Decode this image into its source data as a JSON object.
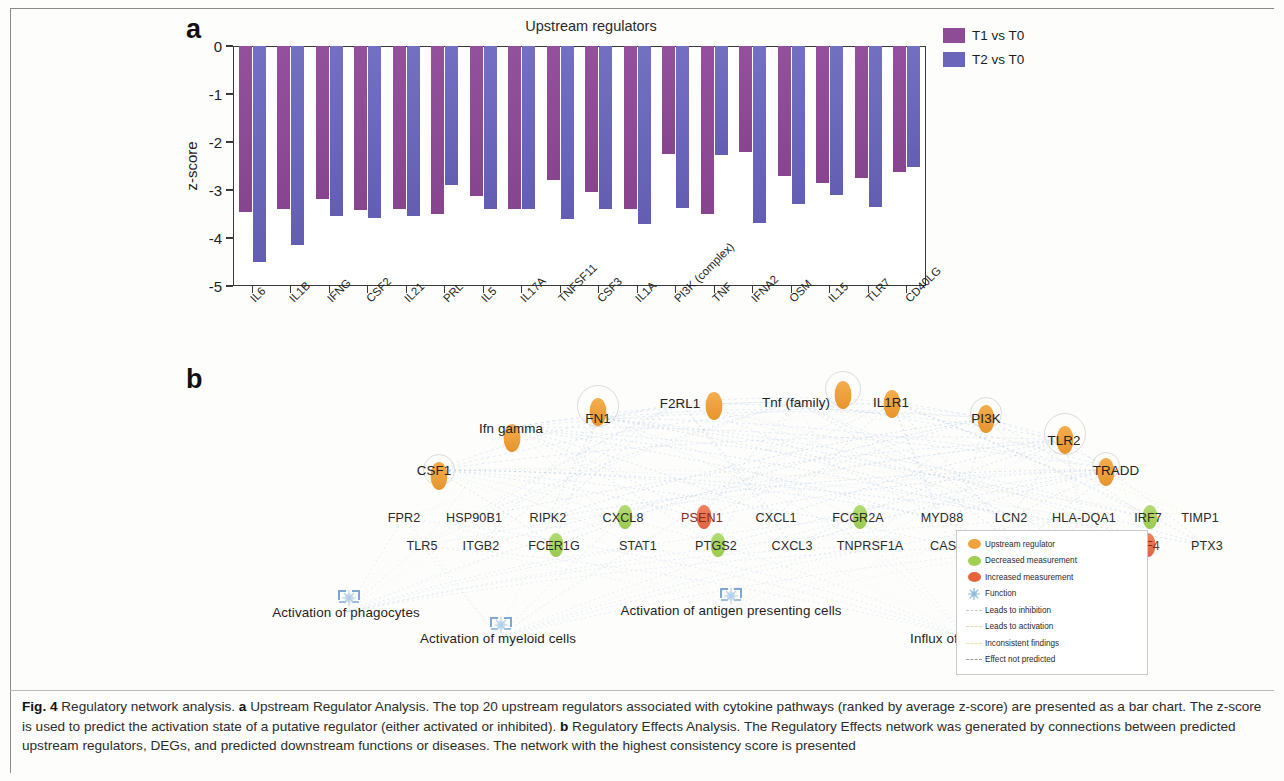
{
  "figure": {
    "label": "Fig. 4",
    "caption_parts": {
      "title": "Regulatory network analysis.",
      "a_tag": "a",
      "a_text": "Upstream Regulator Analysis. The top 20 upstream regulators associated with cytokine pathways (ranked by average z-score) are presented as a bar chart. The z-score is used to predict the activation state of a putative regulator (either activated or inhibited).",
      "b_tag": "b",
      "b_text": "Regulatory Effects Analysis. The Regulatory Effects network was generated by connections between predicted upstream regulators, DEGs, and predicted downstream functions or diseases. The network with the highest consistency score is presented"
    }
  },
  "panel_a": {
    "letter": "a",
    "title": "Upstream regulators",
    "legend": [
      {
        "label": "T1 vs T0",
        "color": "#8e4b96"
      },
      {
        "label": "T2 vs T0",
        "color": "#6b66ba"
      }
    ]
  },
  "chart_data": {
    "type": "bar",
    "title": "Upstream regulators",
    "xlabel": "",
    "ylabel": "z-score",
    "ylim": [
      -5,
      0
    ],
    "yticks": [
      0,
      -1,
      -2,
      -3,
      -4,
      -5
    ],
    "ytick_labels": [
      "0",
      "-1",
      "-2",
      "-3",
      "-4",
      "-5"
    ],
    "grid": false,
    "legend_position": "right",
    "categories": [
      "IL6",
      "IL1B",
      "IFNG",
      "CSF2",
      "IL21",
      "PRL",
      "IL5",
      "IL17A",
      "TNFSF11",
      "CSF3",
      "IL1A",
      "PI3K (complex)",
      "TNF",
      "IFNA2",
      "OSM",
      "IL15",
      "TLR7",
      "CD40LG"
    ],
    "series": [
      {
        "name": "T1 vs T0",
        "color": "#8e4b96",
        "values": [
          -3.45,
          -3.4,
          -3.18,
          -3.42,
          -3.4,
          -3.5,
          -3.12,
          -3.4,
          -2.8,
          -3.05,
          -3.4,
          -2.25,
          -3.5,
          -2.2,
          -2.7,
          -2.85,
          -2.75,
          -2.62
        ]
      },
      {
        "name": "T2 vs T0",
        "color": "#6b66ba",
        "values": [
          -4.5,
          -4.15,
          -3.55,
          -3.58,
          -3.55,
          -2.9,
          -3.4,
          -3.4,
          -3.6,
          -3.4,
          -3.7,
          -3.38,
          -2.28,
          -3.68,
          -3.3,
          -3.1,
          -3.35,
          -2.52
        ]
      }
    ]
  },
  "panel_b": {
    "letter": "b",
    "regulators": [
      {
        "name": "Ifn gamma",
        "x": 325,
        "y": 68,
        "nx": 326,
        "ny": 78,
        "halo": 0
      },
      {
        "name": "CSF1",
        "x": 248,
        "y": 110,
        "nx": 253,
        "ny": 116,
        "halo": 30
      },
      {
        "name": "FN1",
        "x": 412,
        "y": 58,
        "nx": 412,
        "ny": 52,
        "halo": 40
      },
      {
        "name": "F2RL1",
        "x": 494,
        "y": 43,
        "nx": 528,
        "ny": 46,
        "halo": 0
      },
      {
        "name": "Tnf (family)",
        "x": 610,
        "y": 42,
        "nx": 657,
        "ny": 35,
        "halo": 34
      },
      {
        "name": "IL1R1",
        "x": 705,
        "y": 42,
        "nx": 706,
        "ny": 44,
        "halo": 0
      },
      {
        "name": "PI3K",
        "x": 800,
        "y": 58,
        "nx": 800,
        "ny": 59,
        "halo": 30
      },
      {
        "name": "TLR2",
        "x": 878,
        "y": 80,
        "nx": 879,
        "ny": 80,
        "halo": 40
      },
      {
        "name": "TRADD",
        "x": 930,
        "y": 110,
        "nx": 920,
        "ny": 112,
        "halo": 26
      }
    ],
    "genes_row1": [
      {
        "name": "FPR2",
        "x": 218,
        "mark": "none"
      },
      {
        "name": "HSP90B1",
        "x": 288,
        "mark": "none"
      },
      {
        "name": "RIPK2",
        "x": 362,
        "mark": "none"
      },
      {
        "name": "CXCL8",
        "x": 437,
        "mark": "down"
      },
      {
        "name": "PSEN1",
        "x": 516,
        "mark": "up"
      },
      {
        "name": "CXCL1",
        "x": 590,
        "mark": "none"
      },
      {
        "name": "FCGR2A",
        "x": 672,
        "mark": "down"
      },
      {
        "name": "MYD88",
        "x": 756,
        "mark": "none"
      },
      {
        "name": "LCN2",
        "x": 825,
        "mark": "none"
      },
      {
        "name": "HLA-DQA1",
        "x": 898,
        "mark": "none"
      },
      {
        "name": "IRF7",
        "x": 962,
        "mark": "dnup"
      },
      {
        "name": "TIMP1",
        "x": 1014,
        "mark": "none"
      }
    ],
    "genes_row2": [
      {
        "name": "TLR5",
        "x": 236,
        "mark": "none"
      },
      {
        "name": "ITGB2",
        "x": 295,
        "mark": "none"
      },
      {
        "name": "FCER1G",
        "x": 368,
        "mark": "down"
      },
      {
        "name": "STAT1",
        "x": 452,
        "mark": "none"
      },
      {
        "name": "PTGS2",
        "x": 530,
        "mark": "down"
      },
      {
        "name": "CXCL3",
        "x": 606,
        "mark": "none"
      },
      {
        "name": "TNPRSF1A",
        "x": 684,
        "mark": "none"
      },
      {
        "name": "CASP1",
        "x": 765,
        "mark": "none"
      },
      {
        "name": "MMP9",
        "x": 833,
        "mark": "none"
      },
      {
        "name": "CD44",
        "x": 900,
        "mark": "none"
      },
      {
        "name": "IRF4",
        "x": 960,
        "mark": "up"
      },
      {
        "name": "PTX3",
        "x": 1021,
        "mark": "none"
      }
    ],
    "functions": [
      {
        "name": "Activation of phagocytes",
        "x": 160,
        "y": 252,
        "nx": 163,
        "ny": 238
      },
      {
        "name": "Activation of myeloid cells",
        "x": 312,
        "y": 278,
        "nx": 315,
        "ny": 265
      },
      {
        "name": "Activation of antigen presenting cells",
        "x": 545,
        "y": 250,
        "nx": 545,
        "ny": 236
      },
      {
        "name": "Influx of leukocytes",
        "x": 782,
        "y": 278,
        "nx": 785,
        "ny": 265
      }
    ],
    "legend": [
      {
        "label": "Upstream regulator",
        "type": "dot",
        "color": "#f0a33c"
      },
      {
        "label": "Decreased measurement",
        "type": "dot",
        "color": "#9fd04f"
      },
      {
        "label": "Increased measurement",
        "type": "dot",
        "color": "#e8633a"
      },
      {
        "label": "Function",
        "type": "star",
        "color": "#8fb8e0"
      },
      {
        "label": "Leads to inhibition",
        "type": "line",
        "color": "#c9c9c9"
      },
      {
        "label": "Leads to activation",
        "type": "line",
        "color": "#e8d7a8"
      },
      {
        "label": "Inconsistent findings",
        "type": "line",
        "color": "#f0e0a0"
      },
      {
        "label": "Effect not predicted",
        "type": "line",
        "color": "#9a9a9a"
      }
    ]
  }
}
